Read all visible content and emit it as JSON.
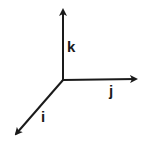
{
  "diagram": {
    "type": "3d-coordinate-axes",
    "origin": [
      63,
      80
    ],
    "stroke_color": "#1a1a1a",
    "background": "#ffffff",
    "axes": [
      {
        "name": "k",
        "label": "k",
        "direction": "up",
        "from": [
          63,
          80
        ],
        "to": [
          63,
          8
        ],
        "label_pos": [
          67,
          52
        ]
      },
      {
        "name": "j",
        "label": "j",
        "direction": "right",
        "from": [
          63,
          80
        ],
        "to": [
          138,
          79
        ],
        "label_pos": [
          109,
          96
        ]
      },
      {
        "name": "i",
        "label": "i",
        "direction": "down-left",
        "from": [
          63,
          80
        ],
        "to": [
          14,
          136
        ],
        "label_pos": [
          41,
          122
        ]
      }
    ]
  }
}
